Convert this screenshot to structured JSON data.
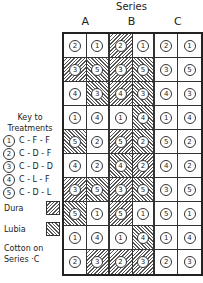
{
  "header": {
    "title": "Series",
    "columns": [
      "A",
      "B",
      "C"
    ]
  },
  "key": {
    "title_line1": "Key to",
    "title_line2": "Treatments",
    "treatments": [
      {
        "num": "1",
        "label": "C - F - F"
      },
      {
        "num": "2",
        "label": "C - D - F"
      },
      {
        "num": "3",
        "label": "C - D - D"
      },
      {
        "num": "4",
        "label": "C - L - F"
      },
      {
        "num": "5",
        "label": "C - D - L"
      }
    ]
  },
  "legend": {
    "dura": "Dura",
    "lubia": "Lubia",
    "cotton_line1": "Cotton on",
    "cotton_line2": "Series ·C"
  },
  "grid": {
    "rows": [
      [
        {
          "n": "2",
          "h": ""
        },
        {
          "n": "1",
          "h": ""
        },
        {
          "n": "2",
          "h": "dura"
        },
        {
          "n": "1",
          "h": ""
        },
        {
          "n": "2",
          "h": ""
        },
        {
          "n": "1",
          "h": ""
        }
      ],
      [
        {
          "n": "3",
          "h": "dura"
        },
        {
          "n": "5",
          "h": "lubia"
        },
        {
          "n": "3",
          "h": "dura"
        },
        {
          "n": "5",
          "h": "lubia"
        },
        {
          "n": "3",
          "h": ""
        },
        {
          "n": "5",
          "h": ""
        }
      ],
      [
        {
          "n": "4",
          "h": ""
        },
        {
          "n": "3",
          "h": "lubia"
        },
        {
          "n": "4",
          "h": "dura"
        },
        {
          "n": "3",
          "h": "lubia"
        },
        {
          "n": "4",
          "h": ""
        },
        {
          "n": "3",
          "h": ""
        }
      ],
      [
        {
          "n": "1",
          "h": ""
        },
        {
          "n": "4",
          "h": ""
        },
        {
          "n": "1",
          "h": ""
        },
        {
          "n": "4",
          "h": "lubia"
        },
        {
          "n": "1",
          "h": ""
        },
        {
          "n": "4",
          "h": ""
        }
      ],
      [
        {
          "n": "5",
          "h": "lubia"
        },
        {
          "n": "2",
          "h": ""
        },
        {
          "n": "5",
          "h": "dura"
        },
        {
          "n": "2",
          "h": "lubia"
        },
        {
          "n": "5",
          "h": ""
        },
        {
          "n": "2",
          "h": ""
        }
      ],
      [
        {
          "n": "4",
          "h": ""
        },
        {
          "n": "2",
          "h": ""
        },
        {
          "n": "4",
          "h": "lubia"
        },
        {
          "n": "2",
          "h": "dura"
        },
        {
          "n": "4",
          "h": ""
        },
        {
          "n": "2",
          "h": ""
        }
      ],
      [
        {
          "n": "3",
          "h": "dura"
        },
        {
          "n": "5",
          "h": "lubia"
        },
        {
          "n": "3",
          "h": "dura"
        },
        {
          "n": "5",
          "h": "lubia"
        },
        {
          "n": "3",
          "h": ""
        },
        {
          "n": "5",
          "h": ""
        }
      ],
      [
        {
          "n": "5",
          "h": "lubia"
        },
        {
          "n": "1",
          "h": ""
        },
        {
          "n": "5",
          "h": "dura"
        },
        {
          "n": "1",
          "h": ""
        },
        {
          "n": "5",
          "h": ""
        },
        {
          "n": "1",
          "h": ""
        }
      ],
      [
        {
          "n": "1",
          "h": ""
        },
        {
          "n": "4",
          "h": ""
        },
        {
          "n": "1",
          "h": ""
        },
        {
          "n": "4",
          "h": "lubia"
        },
        {
          "n": "1",
          "h": ""
        },
        {
          "n": "4",
          "h": ""
        }
      ],
      [
        {
          "n": "2",
          "h": ""
        },
        {
          "n": "3",
          "h": "dura"
        },
        {
          "n": "2",
          "h": "dura"
        },
        {
          "n": "3",
          "h": "dura"
        },
        {
          "n": "2",
          "h": ""
        },
        {
          "n": "3",
          "h": ""
        }
      ]
    ]
  }
}
